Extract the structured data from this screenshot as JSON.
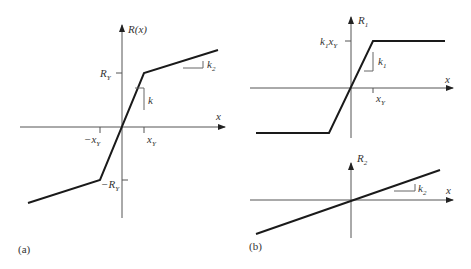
{
  "panel_a": {
    "caption": "(a)",
    "y_axis_label": "R(x)",
    "x_axis_label": "x",
    "tick_ry": "R",
    "tick_ry_sub": "Y",
    "tick_neg_ry": "−R",
    "tick_neg_ry_sub": "Y",
    "tick_xy": "x",
    "tick_xy_sub": "Y",
    "tick_neg_xy": "−x",
    "tick_neg_xy_sub": "Y",
    "slope_initial": "k",
    "slope_post": "k",
    "slope_post_sub": "2"
  },
  "panel_b_top": {
    "caption": "(b)",
    "y_axis_label": "R",
    "y_axis_label_sub": "1",
    "x_axis_label": "x",
    "tick_level": "k",
    "tick_level_sub1": "1",
    "tick_level_x": "x",
    "tick_level_sub2": "Y",
    "tick_xy": "x",
    "tick_xy_sub": "Y",
    "slope": "k",
    "slope_sub": "1"
  },
  "panel_b_bottom": {
    "y_axis_label": "R",
    "y_axis_label_sub": "2",
    "x_axis_label": "x",
    "slope": "k",
    "slope_sub": "2"
  },
  "colors": {
    "curve": "#1a1a1a",
    "axis": "#555555"
  }
}
